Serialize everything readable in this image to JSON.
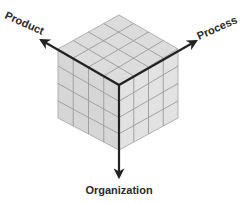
{
  "diagram": {
    "type": "isometric-cube",
    "grid": 4,
    "colors": {
      "top_face": "#dcdcdc",
      "left_face": "#d4d4d4",
      "right_face": "#e2e2e2",
      "grid_line": "#9a9a9a",
      "edge": "#b0b0b0",
      "axis": "#222222",
      "label": "#2a2a2a"
    },
    "axes": [
      {
        "id": "product",
        "label": "Product",
        "direction": "upper-left"
      },
      {
        "id": "process",
        "label": "Process",
        "direction": "upper-right"
      },
      {
        "id": "organization",
        "label": "Organization",
        "direction": "down"
      }
    ]
  }
}
